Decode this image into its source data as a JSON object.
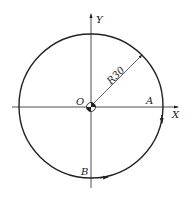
{
  "diagram": {
    "axes": {
      "x_label": "X",
      "y_label": "Y"
    },
    "origin_label": "O",
    "radius_label": "R30",
    "points": {
      "a": "A",
      "b": "B"
    },
    "colors": {
      "stroke": "#222222",
      "background": "#ffffff"
    }
  }
}
